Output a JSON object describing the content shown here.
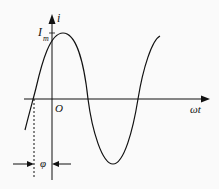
{
  "diagram": {
    "labels": {
      "y_axis": "i",
      "x_axis": "ωt",
      "origin": "O",
      "amplitude": "I",
      "amplitude_sub": "m",
      "phase": "φ"
    },
    "colors": {
      "stroke": "#111111",
      "background": "#fafafa"
    }
  }
}
